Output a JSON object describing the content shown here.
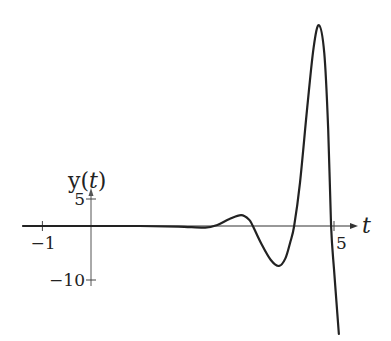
{
  "chart_data": {
    "type": "line",
    "title": "",
    "xlabel": "t",
    "ylabel": "y(t)",
    "ylabel_var": "t",
    "xlim": [
      -1.4,
      5.5
    ],
    "ylim": [
      -21,
      38
    ],
    "xticks": [
      {
        "value": -1,
        "label": "−1"
      },
      {
        "value": 5,
        "label": "5"
      }
    ],
    "yticks": [
      {
        "value": 5,
        "label": "5"
      },
      {
        "value": -10,
        "label": "−10"
      }
    ],
    "grid": false,
    "series": [
      {
        "name": "y(t)",
        "color": "#222222",
        "points": [
          [
            -1.4,
            0
          ],
          [
            0,
            0
          ],
          [
            1.0,
            0
          ],
          [
            1.8,
            -0.1
          ],
          [
            2.35,
            -0.3
          ],
          [
            2.6,
            0.2
          ],
          [
            2.85,
            1.3
          ],
          [
            3.09,
            2.0
          ],
          [
            3.25,
            1.2
          ],
          [
            3.33,
            0
          ],
          [
            3.5,
            -3.2
          ],
          [
            3.7,
            -6.3
          ],
          [
            3.87,
            -7.4
          ],
          [
            4.0,
            -6.0
          ],
          [
            4.1,
            -3.0
          ],
          [
            4.18,
            0
          ],
          [
            4.3,
            8.0
          ],
          [
            4.45,
            22.0
          ],
          [
            4.58,
            33.0
          ],
          [
            4.69,
            37.2
          ],
          [
            4.8,
            32.0
          ],
          [
            4.88,
            18.0
          ],
          [
            4.94,
            0
          ],
          [
            5.0,
            -8.0
          ],
          [
            5.05,
            -14.0
          ],
          [
            5.1,
            -20.0
          ]
        ]
      }
    ]
  }
}
